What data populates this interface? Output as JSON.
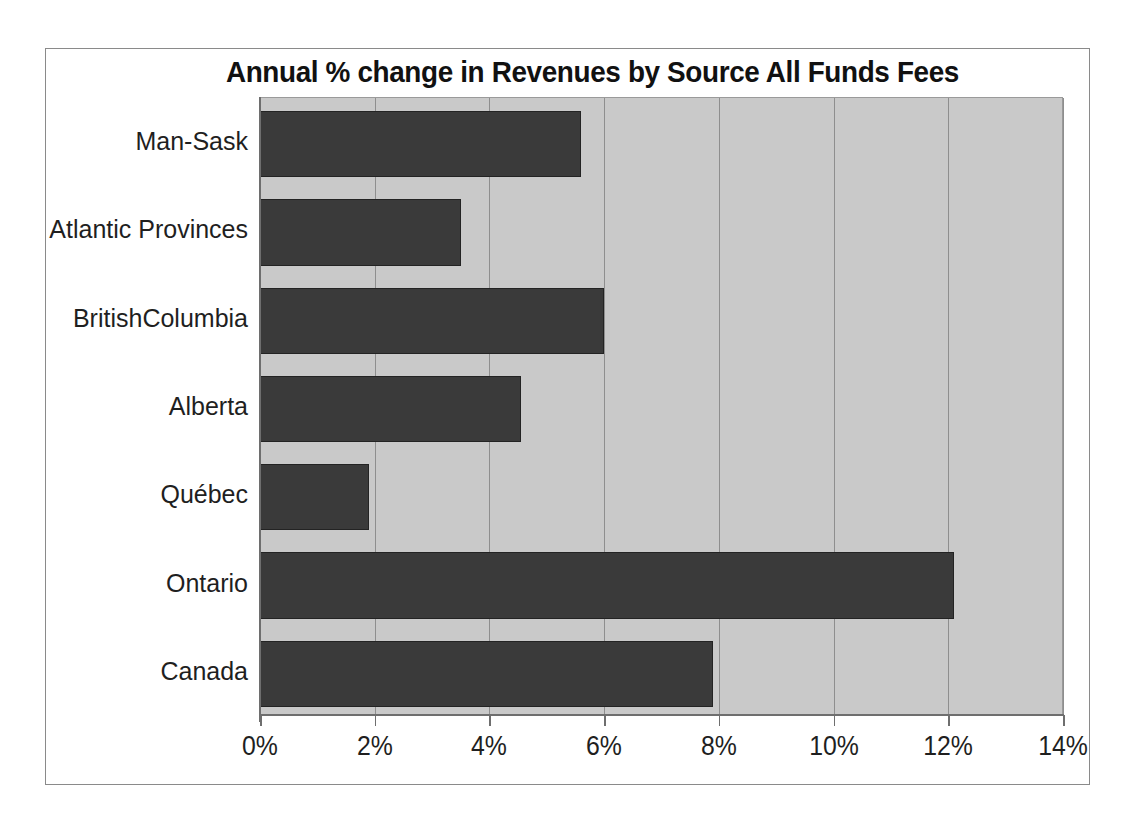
{
  "chart_data": {
    "type": "bar",
    "orientation": "horizontal",
    "title": "Annual % change in Revenues by Source All Funds Fees",
    "xlabel": "",
    "ylabel": "",
    "categories": [
      "Man-Sask",
      "Atlantic Provinces",
      "BritishColumbia",
      "Alberta",
      "Québec",
      "Ontario",
      "Canada"
    ],
    "values": [
      5.6,
      3.5,
      6.0,
      4.55,
      1.9,
      12.1,
      7.9
    ],
    "xlim": [
      0,
      14
    ],
    "xticks": [
      0,
      2,
      4,
      6,
      8,
      10,
      12,
      14
    ],
    "xticklabels": [
      "0%",
      "2%",
      "4%",
      "6%",
      "8%",
      "10%",
      "12%",
      "14%"
    ],
    "grid": true,
    "legend": false,
    "colors": {
      "bar_fill": "#3a3a3a",
      "bar_edge": "#232323",
      "plot_background": "#c9c9c9",
      "gridline": "#8e8e8e",
      "axis": "#6e6e6e",
      "frame": "#8a8a8a",
      "text": "#1f1f1f",
      "figure_background": "#ffffff"
    }
  }
}
